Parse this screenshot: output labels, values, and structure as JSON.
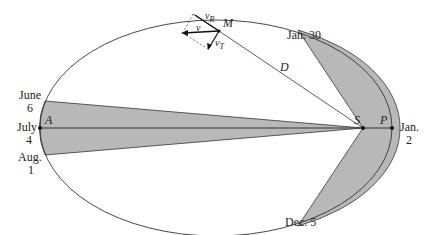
{
  "diagram": {
    "points": {
      "aphelion": "A",
      "perihelion": "P",
      "sun": "S",
      "planet": "M",
      "distance": "D"
    },
    "vectors": {
      "velocity": "v",
      "radial": "v",
      "radial_sub": "R",
      "tangential": "v",
      "tangential_sub": "T"
    },
    "dates": {
      "june_month": "June",
      "june_day": "6",
      "july_month": "July",
      "july_day": "4",
      "aug_month": "Aug.",
      "aug_day": "1",
      "jan30": "Jan. 30",
      "jan2_month": "Jan.",
      "jan2_day": "2",
      "dec5": "Dec. 5"
    },
    "colors": {
      "shade": "#b8b8b8",
      "line": "#333333"
    }
  }
}
